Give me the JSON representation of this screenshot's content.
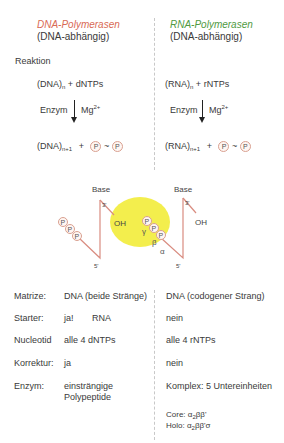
{
  "header": {
    "dna": {
      "title": "DNA-Polymerasen",
      "subtitle": "(DNA-abhängig)"
    },
    "rna": {
      "title": "RNA-Polymerasen",
      "subtitle": "(DNA-abhängig)"
    }
  },
  "colors": {
    "dna_title": "#d96a55",
    "rna_title": "#4f9a3f",
    "strand": "#d98c80",
    "active_site": "#f2ec3a",
    "divider": "#c8c8c8"
  },
  "reaction": {
    "label": "Reaktion",
    "dna": {
      "substrate": "(DNA)",
      "substrate_sub": "n",
      "plus": "+",
      "nucleotides": "dNTPs",
      "enzyme": "Enzym",
      "cofactor": "Mg",
      "cofactor_sup": "2+",
      "product": "(DNA)",
      "product_sub": "n+1",
      "plus2": "+",
      "p1": "P",
      "tilde": "~",
      "p2": "P"
    },
    "rna": {
      "substrate": "(RNA)",
      "substrate_sub": "n",
      "plus": "+",
      "nucleotides": "rNTPs",
      "enzyme": "Enzym",
      "cofactor": "Mg",
      "cofactor_sup": "2+",
      "product": "(RNA)",
      "product_sub": "n+1",
      "plus2": "+",
      "p1": "P",
      "tilde": "~",
      "p2": "P"
    }
  },
  "mechanism": {
    "left": {
      "base": "Base",
      "end3": "3'",
      "end5": "5'",
      "oh": "OH",
      "phosphates": [
        "P",
        "P",
        "P"
      ]
    },
    "right": {
      "base": "Base",
      "end3": "3'",
      "end5": "5'",
      "oh": "OH",
      "phosphates": [
        "P",
        "P",
        "P"
      ],
      "greek": [
        "γ",
        "β",
        "α"
      ]
    }
  },
  "table": {
    "rows": [
      {
        "label": "Matrize:",
        "dna": "DNA (beide Stränge)",
        "rna": "DNA (codogener Strang)"
      },
      {
        "label": "Starter:",
        "dna": "ja!",
        "dna_extra": "RNA",
        "rna": "nein"
      },
      {
        "label": "Nucleotid",
        "dna": "alle 4 dNTPs",
        "rna": "alle 4 rNTPs"
      },
      {
        "label": "Korrektur:",
        "dna": "ja",
        "rna": "nein"
      },
      {
        "label": "Enzym:",
        "dna": "einsträngige",
        "dna_line2": "Polypeptide",
        "rna": "Komplex: 5 Untereinheiten"
      }
    ],
    "core": {
      "prefix": "Core: α",
      "sub": "2",
      "suffix": "ββ'"
    },
    "holo": {
      "prefix": "Holo: α",
      "sub": "2",
      "suffix": "ββ'σ"
    }
  }
}
